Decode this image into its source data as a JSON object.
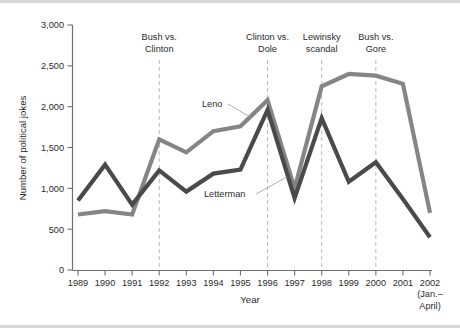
{
  "chart_data": {
    "type": "line",
    "title": "",
    "xlabel": "Year",
    "ylabel": "Number of political jokes",
    "x": [
      "1989",
      "1990",
      "1991",
      "1992",
      "1993",
      "1994",
      "1995",
      "1996",
      "1997",
      "1998",
      "1999",
      "2000",
      "2001",
      "2002"
    ],
    "x_tick_labels": [
      "1989",
      "1990",
      "1991",
      "1992",
      "1993",
      "1994",
      "1995",
      "1996",
      "1997",
      "1998",
      "1999",
      "2000",
      "2001",
      "2002"
    ],
    "x_last_note_line1": "(Jan.–",
    "x_last_note_line2": "April)",
    "ylim": [
      0,
      3000
    ],
    "y_ticks": [
      0,
      500,
      1000,
      1500,
      2000,
      2500,
      3000
    ],
    "y_tick_labels": [
      "0",
      "500",
      "1,000",
      "1,500",
      "2,000",
      "2,500",
      "3,000"
    ],
    "grid": false,
    "legend_position": "inline-labels",
    "series": [
      {
        "name": "Leno",
        "color": "#858585",
        "values": [
          680,
          720,
          680,
          1600,
          1440,
          1700,
          1760,
          2080,
          1000,
          2250,
          2400,
          2380,
          2280,
          700
        ]
      },
      {
        "name": "Letterman",
        "color": "#4a4a4a",
        "values": [
          850,
          1290,
          800,
          1220,
          960,
          1180,
          1230,
          1960,
          880,
          1860,
          1080,
          1320,
          870,
          400
        ]
      }
    ],
    "annotations": [
      {
        "label_line1": "Bush vs.",
        "label_line2": "Clinton",
        "x": "1992"
      },
      {
        "label_line1": "Clinton vs.",
        "label_line2": "Dole",
        "x": "1996"
      },
      {
        "label_line1": "Lewinsky",
        "label_line2": "scandal",
        "x": "1998"
      },
      {
        "label_line1": "Bush vs.",
        "label_line2": "Gore",
        "x": "2000"
      }
    ]
  }
}
